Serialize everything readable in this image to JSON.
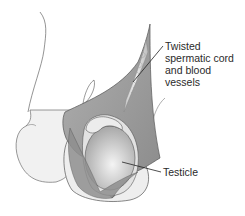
{
  "diagram": {
    "labels": [
      {
        "id": "cord",
        "lines": [
          "Twisted",
          "spermatic cord",
          "and blood",
          "vessels"
        ]
      },
      {
        "id": "testicle",
        "lines": [
          "Testicle"
        ]
      }
    ],
    "colors": {
      "outline": "#555555",
      "skin_fill": "#f1f1f1",
      "tunica_fill": "#9a9a9a",
      "testicle_fill": "#c4c4c4",
      "epididymis_fill": "#e6e6e6",
      "cord_fill": "#d0d0d0",
      "leader_line": "#222222"
    }
  }
}
